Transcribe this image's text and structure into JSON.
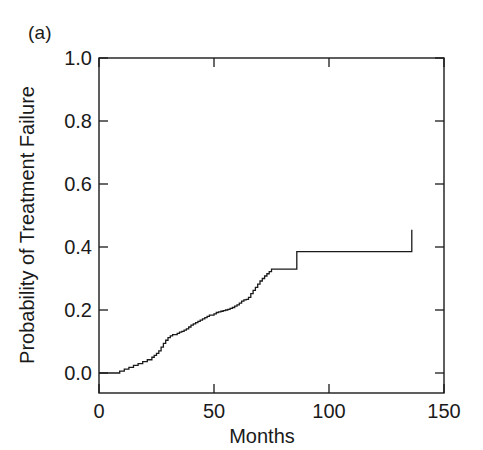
{
  "panel": {
    "label": "(a)"
  },
  "chart_data": {
    "type": "line",
    "subtype": "kaplan-meier-step",
    "title": "",
    "panel_label": "(a)",
    "xlabel": "Months",
    "ylabel": "Probability of Treatment Failure",
    "xlim": [
      0,
      150
    ],
    "ylim": [
      0.0,
      1.0
    ],
    "xticks": [
      0,
      50,
      100,
      150
    ],
    "xtick_labels": [
      "0",
      "50",
      "100",
      "150"
    ],
    "yticks": [
      0.0,
      0.2,
      0.4,
      0.6,
      0.8,
      1.0
    ],
    "ytick_labels": [
      "0.0",
      "0.2",
      "0.4",
      "0.6",
      "0.8",
      "1.0"
    ],
    "grid": false,
    "legend": false,
    "line_color": "#1a1a1a",
    "line_width": 1.3,
    "series": [
      {
        "name": "Cumulative probability of treatment failure",
        "step": "post",
        "x": [
          0,
          6,
          9,
          11,
          13,
          15,
          17,
          19,
          21,
          23,
          24,
          25,
          26,
          27,
          28,
          29,
          30,
          31,
          32,
          34,
          35,
          36,
          37,
          38,
          39,
          40,
          41,
          42,
          43,
          44,
          45,
          46,
          47,
          48,
          50,
          51,
          52,
          53,
          54,
          55,
          56,
          57,
          58,
          59,
          60,
          61,
          62,
          63,
          64,
          65,
          66,
          67,
          68,
          69,
          70,
          71,
          72,
          73,
          74,
          75,
          85,
          86,
          136
        ],
        "y": [
          0.0,
          0.0,
          0.006,
          0.012,
          0.018,
          0.024,
          0.03,
          0.036,
          0.042,
          0.05,
          0.056,
          0.062,
          0.07,
          0.082,
          0.094,
          0.104,
          0.112,
          0.118,
          0.122,
          0.126,
          0.13,
          0.132,
          0.136,
          0.14,
          0.146,
          0.152,
          0.156,
          0.16,
          0.164,
          0.168,
          0.172,
          0.176,
          0.18,
          0.184,
          0.188,
          0.192,
          0.194,
          0.196,
          0.198,
          0.2,
          0.202,
          0.205,
          0.208,
          0.212,
          0.216,
          0.222,
          0.228,
          0.232,
          0.234,
          0.24,
          0.252,
          0.262,
          0.272,
          0.282,
          0.292,
          0.3,
          0.308,
          0.315,
          0.322,
          0.33,
          0.33,
          0.385,
          0.455
        ],
        "final_value": 0.455,
        "max_x_observed": 136
      }
    ]
  }
}
